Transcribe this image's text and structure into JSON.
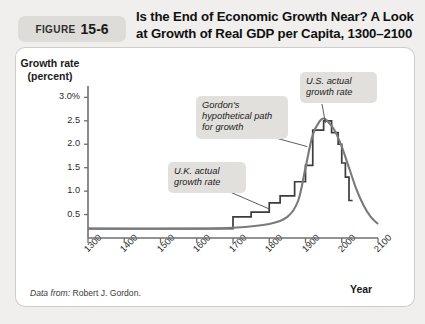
{
  "figure": {
    "badge_word": "FIGURE",
    "badge_number": "15-6",
    "title": "Is the End of Economic Growth Near? A Look at Growth of Real GDP per Capita, 1300–2100"
  },
  "source": {
    "lead": "Data from:",
    "text": " Robert J. Gordon."
  },
  "callouts": {
    "gordon": "Gordon's\nhypothetical path\nfor growth",
    "us": "U.S. actual\ngrowth rate",
    "uk": "U.K. actual\ngrowth rate"
  },
  "colors": {
    "page_background": "#f0efed",
    "panel_background": "#ffffff",
    "badge_background": "#dedcd9",
    "callout_background": "#e2e0dd",
    "axis": "#6f6f6f",
    "curve_smooth": "#7a7a7a",
    "curve_step": "#3c3c3c",
    "leader_line": "#4a4a4a"
  },
  "chart_data": {
    "type": "line",
    "title": "Is the End of Economic Growth Near? A Look at Growth of Real GDP per Capita, 1300–2100",
    "xlabel": "Year",
    "ylabel": "Growth rate (percent)",
    "xlim": [
      1300,
      2100
    ],
    "ylim": [
      0,
      3.2
    ],
    "grid": false,
    "legend": "annotations",
    "y_ticks": [
      "3.0%",
      "2.5",
      "2.0",
      "1.5",
      "1.0",
      "0.5"
    ],
    "y_tick_values": [
      3.0,
      2.5,
      2.0,
      1.5,
      1.0,
      0.5
    ],
    "x_ticks": [
      "1300",
      "1400",
      "1500",
      "1600",
      "1700",
      "1800",
      "1900",
      "2000",
      "2100"
    ],
    "x_tick_values": [
      1300,
      1400,
      1500,
      1600,
      1700,
      1800,
      1900,
      2000,
      2100
    ],
    "series": [
      {
        "name": "U.K. and U.S. actual growth rate",
        "style": "step",
        "color": "#3c3c3c",
        "x": [
          1300,
          1700,
          1700,
          1750,
          1750,
          1800,
          1800,
          1830,
          1830,
          1870,
          1870,
          1900,
          1900,
          1920,
          1920,
          1950,
          1950,
          1972,
          1972,
          1990,
          1990,
          2000,
          2000,
          2010,
          2010,
          2020,
          2020,
          2030
        ],
        "y": [
          0.2,
          0.2,
          0.45,
          0.45,
          0.55,
          0.55,
          0.75,
          0.75,
          0.9,
          0.9,
          1.2,
          1.2,
          1.55,
          1.55,
          2.3,
          2.3,
          2.5,
          2.5,
          2.25,
          2.25,
          2.0,
          2.0,
          1.6,
          1.6,
          1.3,
          1.3,
          0.8,
          0.8
        ]
      },
      {
        "name": "Gordon's hypothetical path for growth",
        "style": "smooth",
        "color": "#7a7a7a",
        "x": [
          1300,
          1600,
          1700,
          1800,
          1850,
          1880,
          1900,
          1920,
          1940,
          1950,
          1960,
          1980,
          2000,
          2020,
          2040,
          2060,
          2080,
          2100
        ],
        "y": [
          0.2,
          0.2,
          0.22,
          0.3,
          0.45,
          0.8,
          1.5,
          2.2,
          2.5,
          2.55,
          2.5,
          2.3,
          1.95,
          1.5,
          1.05,
          0.7,
          0.45,
          0.3
        ]
      }
    ],
    "annotations": [
      {
        "key": "gordon",
        "text": "Gordon's hypothetical path for growth",
        "points_to": [
          1905,
          1.95
        ]
      },
      {
        "key": "us",
        "text": "U.S. actual growth rate",
        "points_to": [
          1955,
          2.45
        ]
      },
      {
        "key": "uk",
        "text": "U.K. actual growth rate",
        "points_to": [
          1800,
          0.62
        ]
      }
    ]
  }
}
